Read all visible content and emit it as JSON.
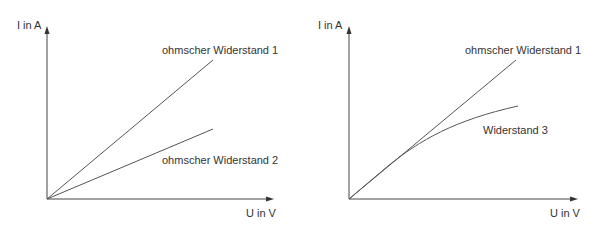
{
  "diagrams": [
    {
      "id": "left",
      "y_axis_label": "I in A",
      "x_axis_label": "U in V",
      "curves": [
        {
          "label": "ohmscher Widerstand 1",
          "type": "linear"
        },
        {
          "label": "ohmscher Widerstand 2",
          "type": "linear"
        }
      ]
    },
    {
      "id": "right",
      "y_axis_label": "I in A",
      "x_axis_label": "U in V",
      "curves": [
        {
          "label": "ohmscher Widerstand 1",
          "type": "linear"
        },
        {
          "label": "Widerstand 3",
          "type": "nonlinear-saturating"
        }
      ]
    }
  ],
  "colors": {
    "line": "#555555",
    "axis": "#444444",
    "text": "#333333",
    "background": "#ffffff"
  }
}
